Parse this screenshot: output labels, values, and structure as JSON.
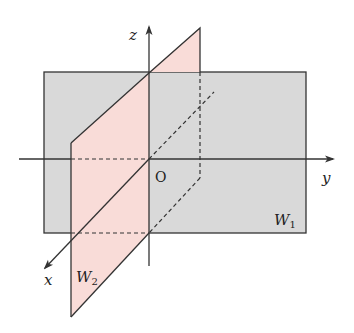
{
  "diagram": {
    "colors": {
      "plane_w1_fill": "#d9d9d9",
      "plane_w2_fill": "#f9dcd8",
      "line": "#333333",
      "background": "#ffffff"
    },
    "labels": {
      "z_axis": "z",
      "y_axis": "y",
      "x_axis": "x",
      "origin": "O",
      "plane_w1": "W",
      "plane_w1_sub": "1",
      "plane_w2": "W",
      "plane_w2_sub": "2"
    }
  }
}
